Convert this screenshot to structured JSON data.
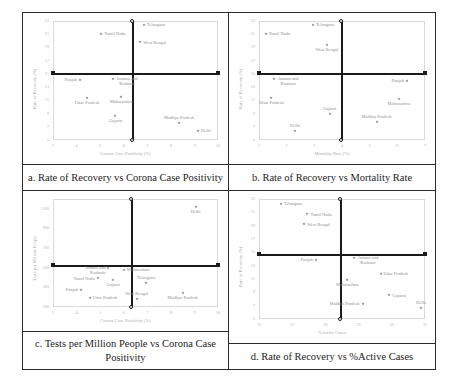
{
  "figure": {
    "cells": [
      {
        "id": "a",
        "caption": "a. Rate of Recovery vs Corona Case Positivity"
      },
      {
        "id": "b",
        "caption": "b. Rate of Recovery vs Mortality Rate"
      },
      {
        "id": "c",
        "caption": "c. Tests per Million People vs Corona Case Positivity"
      },
      {
        "id": "d",
        "caption": "d. Rate of Recovery vs %Active Cases"
      }
    ]
  },
  "chart_data": [
    {
      "type": "scatter",
      "title": "a. Rate of Recovery vs Corona Case Positivity",
      "xlabel": "Corona Case Positivity (%)",
      "ylabel": "Rate of Recovery (%)",
      "xlim": [
        3,
        10
      ],
      "ylim": [
        5,
        23
      ],
      "xticks": [
        3,
        4,
        5,
        6,
        7,
        8,
        9,
        10
      ],
      "yticks": [
        5,
        7,
        9,
        11,
        13,
        15,
        17,
        19,
        21,
        23
      ],
      "grid": false,
      "legend": "none",
      "crosshair": {
        "x": 6.4,
        "y": 15.0
      },
      "points": [
        {
          "label": "Telangana",
          "x": 6.85,
          "y": 22.4
        },
        {
          "label": "Tamil Nadu",
          "x": 5.05,
          "y": 21.1
        },
        {
          "label": "West Bengal",
          "x": 6.7,
          "y": 19.8
        },
        {
          "label": "Punjab",
          "x": 4.15,
          "y": 14.1
        },
        {
          "label": "Jammu and Kashmir",
          "x": 5.55,
          "y": 14.3
        },
        {
          "label": "Uttar Pradesh",
          "x": 4.45,
          "y": 11.3
        },
        {
          "label": "Maharashtra",
          "x": 5.9,
          "y": 11.5
        },
        {
          "label": "Gujarat",
          "x": 5.65,
          "y": 8.6
        },
        {
          "label": "Madhya Pradesh",
          "x": 8.35,
          "y": 7.5
        },
        {
          "label": "Delhi",
          "x": 9.15,
          "y": 6.4
        }
      ]
    },
    {
      "type": "scatter",
      "title": "b. Rate of Recovery vs Mortality Rate",
      "xlabel": "Mortality Rate (%)",
      "ylabel": "Rate of Recovery (%)",
      "xlim": [
        1,
        7
      ],
      "ylim": [
        5,
        23
      ],
      "xticks": [
        1,
        2,
        3,
        4,
        5,
        6,
        7
      ],
      "yticks": [
        5,
        7,
        9,
        11,
        13,
        15,
        17,
        19,
        21,
        23
      ],
      "grid": false,
      "legend": "none",
      "crosshair": {
        "x": 4.0,
        "y": 15.0
      },
      "points": [
        {
          "label": "Telangana",
          "x": 2.95,
          "y": 22.4
        },
        {
          "label": "Tamil Nadu",
          "x": 1.25,
          "y": 21.1
        },
        {
          "label": "West Bengal",
          "x": 3.45,
          "y": 19.3
        },
        {
          "label": "Jammu and Kashmir",
          "x": 1.55,
          "y": 14.2
        },
        {
          "label": "Punjab",
          "x": 6.35,
          "y": 14.0
        },
        {
          "label": "Uttar Pradesh",
          "x": 1.45,
          "y": 11.4
        },
        {
          "label": "Maharashtra",
          "x": 6.05,
          "y": 11.2
        },
        {
          "label": "Gujarat",
          "x": 3.55,
          "y": 8.9
        },
        {
          "label": "Madhya Pradesh",
          "x": 5.25,
          "y": 7.7
        },
        {
          "label": "Delhi",
          "x": 2.3,
          "y": 6.3
        }
      ]
    },
    {
      "type": "scatter",
      "title": "c. Tests per Million People vs Corona Case Positivity",
      "xlabel": "Corona Case Positivity (%)",
      "ylabel": "Tests per Million People",
      "xlim": [
        3,
        10
      ],
      "ylim": [
        100,
        1200
      ],
      "xticks": [
        3,
        4,
        5,
        6,
        7,
        8,
        9,
        10
      ],
      "yticks": [
        100,
        300,
        500,
        700,
        900,
        1100
      ],
      "grid": false,
      "legend": "none",
      "crosshair": {
        "x": 6.35,
        "y": 520
      },
      "points": [
        {
          "label": "Delhi",
          "x": 9.05,
          "y": 1120
        },
        {
          "label": "Jammu and Kashmir",
          "x": 5.35,
          "y": 500
        },
        {
          "label": "Maharashtra",
          "x": 6.0,
          "y": 480
        },
        {
          "label": "Tamil Nadu",
          "x": 4.9,
          "y": 395
        },
        {
          "label": "Gujarat",
          "x": 5.55,
          "y": 370
        },
        {
          "label": "Telangana",
          "x": 6.95,
          "y": 345
        },
        {
          "label": "Punjab",
          "x": 4.2,
          "y": 275
        },
        {
          "label": "Madhya Pradesh",
          "x": 8.5,
          "y": 245
        },
        {
          "label": "Uttar Pradesh",
          "x": 4.55,
          "y": 195
        },
        {
          "label": "West Bengal",
          "x": 6.55,
          "y": 185
        }
      ]
    },
    {
      "type": "scatter",
      "title": "d. Rate of Recovery vs %Active Cases",
      "xlabel": "%Active Cases",
      "ylabel": "Rate of Recovery (%)",
      "xlim": [
        10,
        35
      ],
      "ylim": [
        5,
        23
      ],
      "xticks": [
        10,
        15,
        20,
        25,
        30,
        35
      ],
      "yticks": [
        5,
        7,
        9,
        11,
        13,
        15,
        17,
        19,
        21,
        23
      ],
      "grid": false,
      "legend": "none",
      "crosshair": {
        "x": 22.3,
        "y": 14.6
      },
      "points": [
        {
          "label": "Telangana",
          "x": 13.3,
          "y": 22.3
        },
        {
          "label": "Tamil Nadu",
          "x": 17.3,
          "y": 20.7
        },
        {
          "label": "West Bengal",
          "x": 16.8,
          "y": 19.2
        },
        {
          "label": "Punjab",
          "x": 18.6,
          "y": 13.9
        },
        {
          "label": "Jammu and Kashmir",
          "x": 24.3,
          "y": 14.2
        },
        {
          "label": "Uttar Pradesh",
          "x": 28.3,
          "y": 11.8
        },
        {
          "label": "Maharashtra",
          "x": 23.3,
          "y": 10.9
        },
        {
          "label": "Gujarat",
          "x": 29.6,
          "y": 8.6
        },
        {
          "label": "Madhya Pradesh",
          "x": 25.6,
          "y": 7.3
        },
        {
          "label": "Delhi",
          "x": 34.4,
          "y": 6.6
        }
      ]
    }
  ]
}
